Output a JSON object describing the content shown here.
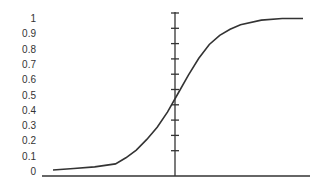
{
  "chart_data": {
    "type": "line",
    "title": "",
    "xlabel": "",
    "ylabel": "",
    "yticks": [
      "0",
      "0.1",
      "0.2",
      "0.3",
      "0.4",
      "0.5",
      "0.6",
      "0.7",
      "0.8",
      "0.9",
      "1"
    ],
    "ylim": [
      0,
      1
    ],
    "xlim": [
      -6,
      6
    ],
    "grid": false,
    "legend": null,
    "series": [
      {
        "name": "sigmoid",
        "x": [
          -6,
          -5,
          -4,
          -3,
          -2.5,
          -2,
          -1.5,
          -1,
          -0.5,
          0,
          0.5,
          1,
          1.5,
          2,
          2.5,
          3,
          4,
          5,
          6
        ],
        "values": [
          0.0,
          0.01,
          0.02,
          0.04,
          0.08,
          0.13,
          0.2,
          0.28,
          0.38,
          0.5,
          0.62,
          0.73,
          0.82,
          0.88,
          0.92,
          0.95,
          0.98,
          0.99,
          0.99
        ]
      }
    ],
    "axis_color": "#333333",
    "line_color": "#333333"
  }
}
